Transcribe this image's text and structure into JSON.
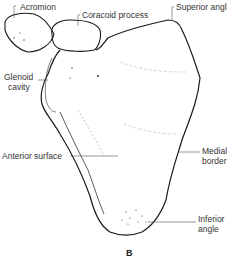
{
  "figure": {
    "panel_label": "B",
    "labels": {
      "acromion": "Acromion",
      "coracoid_process": "Coracoid process",
      "superior_angle": "Superior angle",
      "glenoid_line1": "Glenoid",
      "glenoid_line2": "cavity",
      "anterior_surface": "Anterior surface",
      "medial_line1": "Medial",
      "medial_line2": "border",
      "inferior_line1": "Inferior",
      "inferior_line2": "angle"
    },
    "colors": {
      "outline": "#1a1a1a",
      "leader": "#555555",
      "background": "#ffffff"
    }
  }
}
